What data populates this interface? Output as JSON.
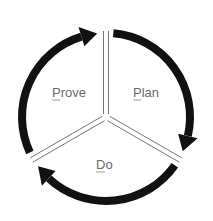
{
  "diagram": {
    "type": "cycle",
    "stages": [
      {
        "label": "Plan",
        "mnemonic": "P"
      },
      {
        "label": "Do",
        "mnemonic": "D"
      },
      {
        "label": "Prove",
        "mnemonic": "P"
      }
    ],
    "direction": "clockwise",
    "colors": {
      "arrow": "#111111",
      "divider": "#777777",
      "text": "#6a6a6a",
      "underline": "#8aaa8a"
    }
  }
}
